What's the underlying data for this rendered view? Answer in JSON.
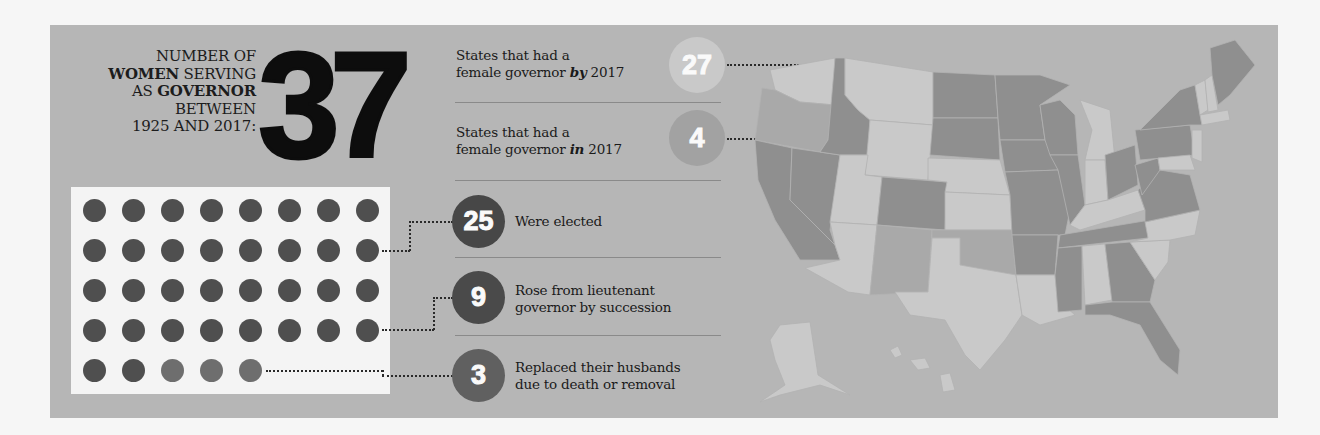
{
  "headline": {
    "line1": "NUMBER OF",
    "line2_bold": "WOMEN",
    "line2_rest": " SERVING",
    "line3_pre": "AS ",
    "line3_bold": "GOVERNOR",
    "line4": "BETWEEN",
    "line5": "1925 AND 2017:",
    "total": "37"
  },
  "dot_grid": {
    "columns": 8,
    "rows": 5,
    "total": 37,
    "elected": 25,
    "succession": 9,
    "replaced_husbands": 3
  },
  "stats": [
    {
      "id": "by2017",
      "line1": "States that had a",
      "line2_pre": "female governor ",
      "line2_em": "by",
      "line2_post": " 2017",
      "value": "27",
      "color": "#c9c9c9"
    },
    {
      "id": "in2017",
      "line1": "States that had a",
      "line2_pre": "female governor ",
      "line2_em": "in",
      "line2_post": " 2017",
      "value": "4",
      "color": "#a2a2a2"
    },
    {
      "id": "elected",
      "line1": "Were elected",
      "line2": "",
      "value": "25",
      "color": "#474747"
    },
    {
      "id": "succession",
      "line1": "Rose from lieutenant",
      "line2": "governor by succession",
      "value": "9",
      "color": "#4a4a4a"
    },
    {
      "id": "replaced",
      "line1": "Replaced their husbands",
      "line2": "due to death or removal",
      "value": "3",
      "color": "#606060"
    }
  ],
  "map": {
    "legend_light": "State had a female governor by 2017",
    "legend_mid": "State had a female governor in 2017",
    "legend_dark": "State never had a female governor",
    "colors": {
      "light": "#c9c9c9",
      "mid": "#a9a9a9",
      "dark": "#8f8f8f"
    }
  }
}
